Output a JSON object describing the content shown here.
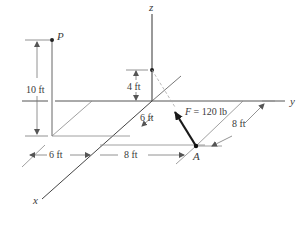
{
  "figure": {
    "type": "3D statics force diagram",
    "axes": {
      "x": "x",
      "y": "y",
      "z": "z"
    },
    "points": {
      "P": "P",
      "A": "A"
    },
    "force": {
      "label": "F = 120 lb",
      "symbol": "F",
      "magnitude": "120 lb"
    },
    "dimensions": {
      "p_height": "10 ft",
      "z_height": "4 ft",
      "x_offset_near": "6 ft",
      "x_offset_bottom": "6 ft",
      "y_offset_bottom": "8 ft",
      "a_depth": "8 ft"
    },
    "colors": {
      "line": "#4a4a4a",
      "light_line": "#8a8a8a",
      "force_arrow": "#1a1a1a",
      "text": "#3a3a3a"
    }
  }
}
